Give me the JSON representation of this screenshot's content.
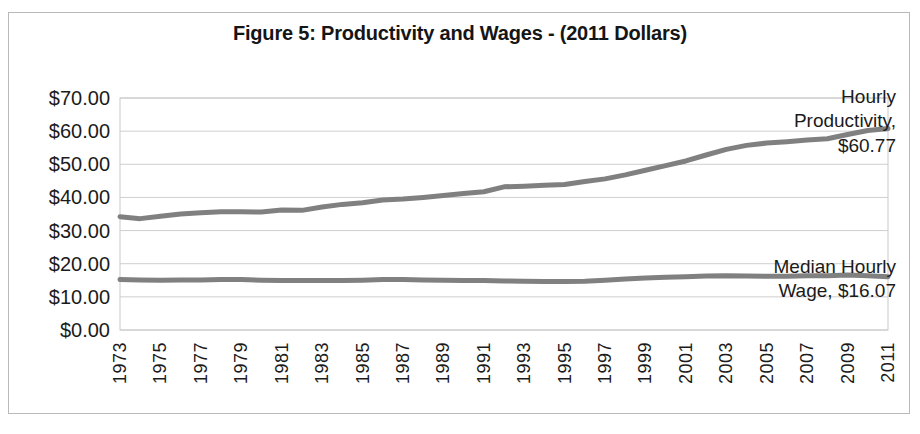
{
  "figure": {
    "title": "Figure 5: Productivity and Wages - (2011 Dollars)",
    "border_color": "#b9b9b9",
    "background": "#ffffff"
  },
  "annotations": {
    "productivity": "Hourly\nProductivity,\n$60.77",
    "wage": "Median Hourly\nWage, $16.07"
  },
  "axes": {
    "y_tick_labels": [
      "$70.00",
      "$60.00",
      "$50.00",
      "$40.00",
      "$30.00",
      "$20.00",
      "$10.00",
      "$0.00"
    ],
    "x_tick_labels": [
      "1973",
      "1975",
      "1977",
      "1979",
      "1981",
      "1983",
      "1985",
      "1987",
      "1989",
      "1991",
      "1993",
      "1995",
      "1997",
      "1999",
      "2001",
      "2003",
      "2005",
      "2007",
      "2009",
      "2011"
    ]
  },
  "chart_data": {
    "type": "line",
    "title": "Figure 5: Productivity and Wages - (2011 Dollars)",
    "xlabel": "",
    "ylabel": "",
    "xlim": [
      1973,
      2011
    ],
    "ylim": [
      0,
      70
    ],
    "ytick_values": [
      0,
      10,
      20,
      30,
      40,
      50,
      60,
      70
    ],
    "ytick_format": "$0.00",
    "xtick_values": [
      1973,
      1975,
      1977,
      1979,
      1981,
      1983,
      1985,
      1987,
      1989,
      1991,
      1993,
      1995,
      1997,
      1999,
      2001,
      2003,
      2005,
      2007,
      2009,
      2011
    ],
    "grid": true,
    "grid_axis": "y",
    "legend": "none",
    "line_color": "#808080",
    "line_width": 5,
    "x": [
      1973,
      1974,
      1975,
      1976,
      1977,
      1978,
      1979,
      1980,
      1981,
      1982,
      1983,
      1984,
      1985,
      1986,
      1987,
      1988,
      1989,
      1990,
      1991,
      1992,
      1993,
      1994,
      1995,
      1996,
      1997,
      1998,
      1999,
      2000,
      2001,
      2002,
      2003,
      2004,
      2005,
      2006,
      2007,
      2008,
      2009,
      2010,
      2011
    ],
    "series": [
      {
        "name": "Hourly Productivity",
        "label": "Hourly Productivity, $60.77",
        "end_value": 60.77,
        "values": [
          34.2,
          33.6,
          34.3,
          35.0,
          35.4,
          35.7,
          35.7,
          35.6,
          36.2,
          36.1,
          37.1,
          37.9,
          38.4,
          39.2,
          39.5,
          40.0,
          40.6,
          41.2,
          41.7,
          43.2,
          43.4,
          43.7,
          43.9,
          44.8,
          45.6,
          46.8,
          48.2,
          49.6,
          51.0,
          52.8,
          54.5,
          55.7,
          56.4,
          56.8,
          57.3,
          57.7,
          59.0,
          60.2,
          60.77
        ]
      },
      {
        "name": "Median Hourly Wage",
        "label": "Median Hourly Wage, $16.07",
        "end_value": 16.07,
        "values": [
          15.2,
          15.1,
          15.0,
          15.1,
          15.1,
          15.2,
          15.2,
          15.0,
          14.9,
          14.9,
          14.9,
          14.9,
          15.0,
          15.2,
          15.2,
          15.1,
          15.0,
          14.9,
          14.9,
          14.8,
          14.7,
          14.6,
          14.6,
          14.7,
          15.0,
          15.4,
          15.7,
          15.9,
          16.1,
          16.3,
          16.4,
          16.3,
          16.2,
          16.2,
          16.4,
          16.4,
          16.6,
          16.4,
          16.07
        ]
      }
    ]
  }
}
